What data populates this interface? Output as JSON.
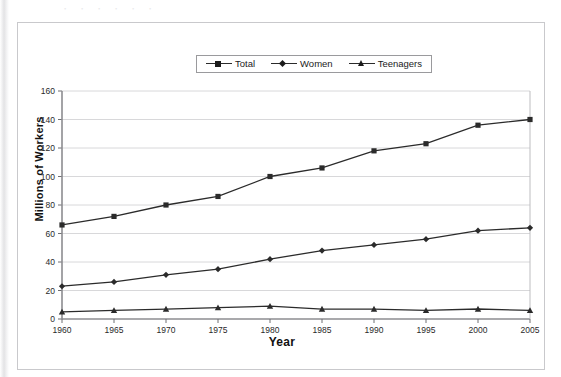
{
  "figure": {
    "top_artifact_text": "ㆍ       ㆍ     ㆍ        ㆍ   ㆍ  ㆍ",
    "axis_titles": {
      "x": "Year",
      "y": "Millions of Workers"
    }
  },
  "legend": {
    "position": "top-center",
    "entries": [
      {
        "label": "Total",
        "marker": "square-marker-icon",
        "color": "#1c1c1c"
      },
      {
        "label": "Women",
        "marker": "diamond-marker-icon",
        "color": "#1c1c1c"
      },
      {
        "label": "Teenagers",
        "marker": "triangle-marker-icon",
        "color": "#1c1c1c"
      }
    ]
  },
  "chart_data": {
    "type": "line",
    "title": "",
    "xlabel": "Year",
    "ylabel": "Millions of Workers",
    "x": [
      1960,
      1965,
      1970,
      1975,
      1980,
      1985,
      1990,
      1995,
      2000,
      2005
    ],
    "xticklabels": [
      "1960",
      "1965",
      "1970",
      "1975",
      "1980",
      "1985",
      "1990",
      "1995",
      "2000",
      "2005"
    ],
    "yticklabels": [
      "0",
      "20",
      "40",
      "60",
      "80",
      "100",
      "120",
      "140",
      "160"
    ],
    "xlim": [
      1960,
      2005
    ],
    "ylim": [
      0,
      160
    ],
    "ytick_step": 20,
    "grid": "horizontal",
    "legend_position": "top-center",
    "series": [
      {
        "name": "Total",
        "marker": "square",
        "color": "#2b2b2b",
        "values": [
          66,
          72,
          80,
          86,
          100,
          106,
          118,
          123,
          136,
          140
        ]
      },
      {
        "name": "Women",
        "marker": "diamond",
        "color": "#2b2b2b",
        "values": [
          23,
          26,
          31,
          35,
          42,
          48,
          52,
          56,
          62,
          64
        ]
      },
      {
        "name": "Teenagers",
        "marker": "triangle",
        "color": "#2b2b2b",
        "values": [
          5,
          6,
          7,
          8,
          9,
          7,
          7,
          6,
          7,
          6
        ]
      }
    ]
  }
}
